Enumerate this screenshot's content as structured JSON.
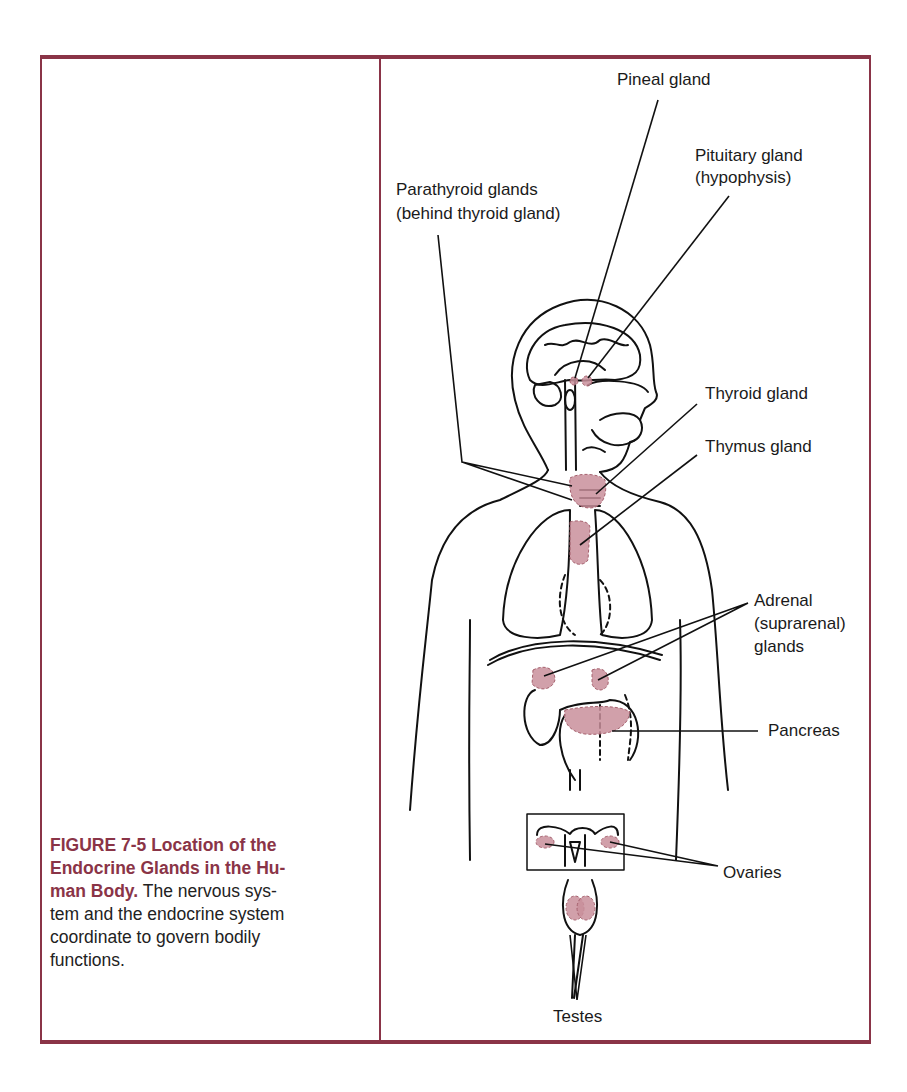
{
  "figure": {
    "number": "FIGURE 7-5",
    "title_lines": [
      "FIGURE 7-5   Location of the",
      "Endocrine Glands in the Hu-",
      "man Body."
    ],
    "caption_lines": [
      " The nervous sys-",
      "tem and the endocrine system",
      "coordinate to govern bodily",
      "functions."
    ],
    "caption": "The nervous system and the endocrine system coordinate to govern bodily functions."
  },
  "colors": {
    "accent": "#8a3447",
    "gland_fill": "#c98f9b",
    "line": "#111111"
  },
  "labels": {
    "pineal": "Pineal gland",
    "pituitary_1": "Pituitary gland",
    "pituitary_2": "(hypophysis)",
    "parathyroid_1": "Parathyroid glands",
    "parathyroid_2": "(behind thyroid gland)",
    "thyroid": "Thyroid gland",
    "thymus": "Thymus gland",
    "adrenal_1": "Adrenal",
    "adrenal_2": "(suprarenal)",
    "adrenal_3": "glands",
    "pancreas": "Pancreas",
    "ovaries": "Ovaries",
    "testes": "Testes"
  }
}
